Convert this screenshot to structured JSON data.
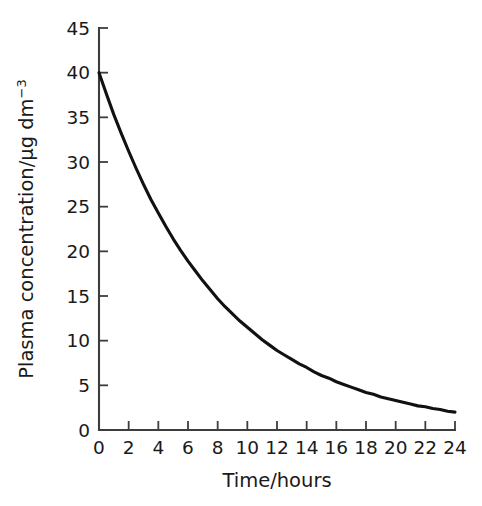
{
  "chart_data": {
    "type": "line",
    "title": "",
    "xlabel": "Time/hours",
    "ylabel": "Plasma concentration/μg dm",
    "ylabel_exponent": "−3",
    "ylabel_full": "Plasma concentration/μg dm⁻³",
    "xlim": [
      0,
      24
    ],
    "ylim": [
      0,
      45
    ],
    "grid": false,
    "legend": null,
    "xticks": [
      0,
      2,
      4,
      6,
      8,
      10,
      12,
      14,
      16,
      18,
      20,
      22,
      24
    ],
    "xtick_labels": [
      "0",
      "2",
      "4",
      "6",
      "8",
      "10",
      "12",
      "14",
      "16",
      "18",
      "20",
      "22",
      "24"
    ],
    "yticks": [
      0,
      5,
      10,
      15,
      20,
      25,
      30,
      35,
      40,
      45
    ],
    "ytick_labels": [
      "0",
      "5",
      "10",
      "15",
      "20",
      "25",
      "30",
      "35",
      "40",
      "45"
    ],
    "series": [
      {
        "name": "Plasma concentration",
        "color": "#111111",
        "x": [
          0,
          0.5,
          1,
          1.5,
          2,
          2.5,
          3,
          3.5,
          4,
          4.5,
          5,
          5.5,
          6,
          6.5,
          7,
          7.5,
          8,
          8.5,
          9,
          9.5,
          10,
          10.5,
          11,
          11.5,
          12,
          12.5,
          13,
          13.5,
          14,
          14.5,
          15,
          15.5,
          16,
          16.5,
          17,
          17.5,
          18,
          18.5,
          19,
          19.5,
          20,
          20.5,
          21,
          21.5,
          22,
          22.5,
          23,
          23.5,
          24
        ],
        "values": [
          40.0,
          37.6,
          35.3,
          33.2,
          31.2,
          29.3,
          27.5,
          25.8,
          24.3,
          22.8,
          21.4,
          20.1,
          18.9,
          17.8,
          16.7,
          15.7,
          14.7,
          13.8,
          13.0,
          12.2,
          11.5,
          10.8,
          10.1,
          9.5,
          8.9,
          8.4,
          7.9,
          7.4,
          7.0,
          6.5,
          6.1,
          5.8,
          5.4,
          5.1,
          4.8,
          4.5,
          4.2,
          4.0,
          3.7,
          3.5,
          3.3,
          3.1,
          2.9,
          2.7,
          2.6,
          2.4,
          2.3,
          2.1,
          2.0
        ]
      }
    ],
    "equation_note": "C = 40 · e^(−0.125 t)"
  }
}
